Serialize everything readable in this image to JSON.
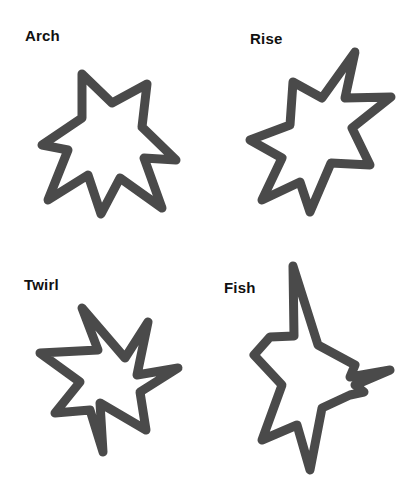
{
  "figure": {
    "background": "#ffffff",
    "stroke_color": "#4a4a4a",
    "label_color": "#111111",
    "shapes": [
      {
        "name": "Arch",
        "label": "Arch",
        "points": "82,74 112,103 147,84 142,127 176,160 144,158 162,208 120,178 101,214 88,175 48,200 68,150 42,145 82,118"
      },
      {
        "name": "Rise",
        "label": "Rise",
        "points": "355,52 345,98 391,97 352,128 370,165 331,163 310,212 300,182 262,200 282,158 250,140 290,125 293,82 322,98"
      },
      {
        "name": "Twirl",
        "label": "Twirl",
        "points": "82,308 125,358 148,322 137,375 178,368 140,392 146,430 100,403 103,452 90,410 55,413 80,382 40,353 98,350"
      },
      {
        "name": "Fish",
        "label": "Fish",
        "points": "293,266 318,345 355,365 350,377 390,370 355,385 364,392 350,395 322,408 310,470 297,425 262,440 282,385 254,355 270,337 294,336"
      }
    ]
  }
}
